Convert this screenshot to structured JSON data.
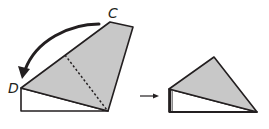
{
  "figure": {
    "colors": {
      "fill": "#c8c8c8",
      "stroke": "#231f20",
      "background": "#ffffff"
    },
    "labels": {
      "point_c": "C",
      "point_d": "D"
    },
    "before": {
      "fold_line": "dotted",
      "arrow": "curved arrow from C to D"
    },
    "transition_arrow": "right arrow",
    "after": {
      "shape": "folded triangle"
    }
  }
}
